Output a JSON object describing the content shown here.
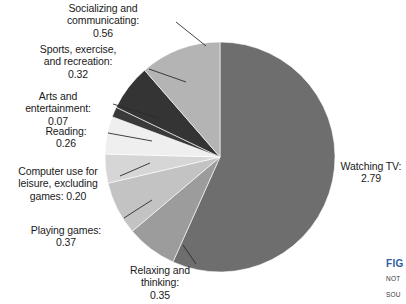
{
  "figure": {
    "caption_label": "FIG",
    "note_label": "NOT",
    "source_label": "SOU"
  },
  "labels": {
    "socializing": "Socializing and\ncommunicating:\n0.56",
    "sports": "Sports, exercise,\nand recreation:\n0.32",
    "arts": "Arts and\nentertainment:\n0.07",
    "reading": "Reading:\n0.26",
    "computer": "Computer use for\nleisure, excluding\ngames: 0.20",
    "playing_games": "Playing games:\n0.37",
    "relaxing": "Relaxing and\nthinking:\n0.35",
    "watching_tv": "Watching TV:\n2.79"
  },
  "chart_data": {
    "type": "pie",
    "title": "",
    "xlabel": "",
    "ylabel": "",
    "total": 4.92,
    "units": "hours per day",
    "start_angle_deg": 0,
    "direction": "clockwise",
    "legend": "none",
    "grid": false,
    "categories": [
      "Watching TV",
      "Relaxing and thinking",
      "Playing games",
      "Computer use for leisure, excluding games",
      "Reading",
      "Arts and entertainment",
      "Sports, exercise, and recreation",
      "Socializing and communicating"
    ],
    "values": [
      2.79,
      0.35,
      0.37,
      0.2,
      0.26,
      0.07,
      0.32,
      0.56
    ],
    "colors": [
      "#6e6e6e",
      "#9c9c9c",
      "#c3c3c3",
      "#d6d6d6",
      "#efefef",
      "#3a3a3a",
      "#343434",
      "#b4b4b4"
    ],
    "value_labels": [
      "2.79",
      "0.35",
      "0.37",
      "0.20",
      "0.26",
      "0.07",
      "0.32",
      "0.56"
    ],
    "geometry": {
      "cx": 220,
      "cy": 157,
      "r": 115
    }
  }
}
